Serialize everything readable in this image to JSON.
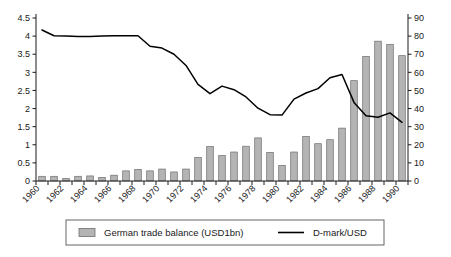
{
  "chart_data": {
    "type": "bar",
    "title": "",
    "subtitle": "",
    "xlabel": "",
    "ylabel": "",
    "y2label": "",
    "grid": false,
    "legend_position": "bottom",
    "x": [
      1960,
      1961,
      1962,
      1963,
      1964,
      1965,
      1966,
      1967,
      1968,
      1969,
      1970,
      1971,
      1972,
      1973,
      1974,
      1975,
      1976,
      1977,
      1978,
      1979,
      1980,
      1981,
      1982,
      1983,
      1984,
      1985,
      1986,
      1987,
      1988,
      1989,
      1990
    ],
    "xtick_labels": [
      "1960",
      "1962",
      "1964",
      "1966",
      "1968",
      "1970",
      "1972",
      "1974",
      "1976",
      "1978",
      "1980",
      "1982",
      "1984",
      "1986",
      "1988",
      "1990"
    ],
    "xtick_values": [
      1960,
      1962,
      1964,
      1966,
      1968,
      1970,
      1972,
      1974,
      1976,
      1978,
      1980,
      1982,
      1984,
      1986,
      1988,
      1990
    ],
    "ylim": [
      0,
      4.5
    ],
    "ytick_labels": [
      "0",
      "0.5",
      "1",
      "1.5",
      "2",
      "2.5",
      "3",
      "3.5",
      "4",
      "4.5"
    ],
    "ytick_values": [
      0,
      0.5,
      1,
      1.5,
      2,
      2.5,
      3,
      3.5,
      4,
      4.5
    ],
    "y2lim": [
      0,
      90
    ],
    "y2tick_labels": [
      "0",
      "10",
      "20",
      "30",
      "40",
      "50",
      "60",
      "70",
      "80",
      "90"
    ],
    "y2tick_values": [
      0,
      10,
      20,
      30,
      40,
      50,
      60,
      70,
      80,
      90
    ],
    "series": [
      {
        "name": "German trade balance (USD1bn)",
        "type": "bar",
        "axis": "left",
        "color": "#b4b4b4",
        "edge_color": "#6e6e6e",
        "values": [
          0.13,
          0.13,
          0.07,
          0.13,
          0.14,
          0.1,
          0.16,
          0.28,
          0.32,
          0.28,
          0.33,
          0.25,
          0.33,
          0.65,
          0.95,
          0.7,
          0.8,
          0.96,
          1.19,
          0.79,
          0.43,
          0.8,
          1.23,
          1.03,
          1.14,
          1.46,
          2.77,
          3.44,
          3.86,
          3.77,
          3.46
        ]
      },
      {
        "name": "D-mark/USD",
        "type": "line",
        "axis": "left_equivalent_right",
        "color": "#000000",
        "values": [
          4.17,
          4.01,
          4.0,
          3.99,
          3.99,
          4.0,
          4.01,
          4.01,
          4.01,
          3.72,
          3.67,
          3.5,
          3.19,
          2.67,
          2.41,
          2.62,
          2.52,
          2.32,
          2.01,
          1.83,
          1.82,
          2.26,
          2.43,
          2.55,
          2.85,
          2.94,
          2.17,
          1.8,
          1.76,
          1.88,
          1.62
        ]
      }
    ],
    "legend": [
      {
        "label": "German trade balance (USD1bn)",
        "marker": "bar-swatch",
        "color": "#b4b4b4"
      },
      {
        "label": "D-mark/USD",
        "marker": "line",
        "color": "#000000"
      }
    ]
  },
  "colors": {
    "bar_fill": "#b4b4b4",
    "bar_edge": "#6e6e6e",
    "line": "#000000",
    "axis": "#1a1a1a",
    "background": "#ffffff",
    "legend_border": "#555555"
  }
}
